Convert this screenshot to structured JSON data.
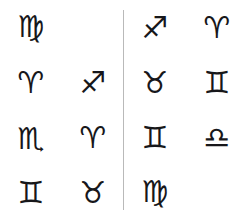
{
  "canvas": {
    "width": 248,
    "height": 220,
    "background": "#ffffff",
    "glyph_color": "#17171a",
    "divider_color": "#b9b9b9"
  },
  "symbols": {
    "virgo": {
      "name": "virgo-symbol",
      "char": "♍",
      "label": "Virgo",
      "size": 30
    },
    "aries": {
      "name": "aries-symbol",
      "char": "♈",
      "label": "Aries",
      "size": 30
    },
    "sagittarius": {
      "name": "sagittarius-symbol",
      "char": "♐",
      "label": "Sagittarius",
      "size": 30
    },
    "scorpio": {
      "name": "scorpio-symbol",
      "char": "♏",
      "label": "Scorpio",
      "size": 30
    },
    "gemini": {
      "name": "gemini-symbol",
      "char": "♊",
      "label": "Gemini",
      "size": 30
    },
    "taurus": {
      "name": "taurus-symbol",
      "char": "♉",
      "label": "Taurus",
      "size": 30
    },
    "libra": {
      "name": "libra-symbol",
      "char": "♎",
      "label": "Libra",
      "size": 30
    }
  },
  "panels": [
    {
      "id": "left-panel",
      "cells": [
        {
          "symbol": "virgo",
          "char": "♍",
          "label": "Virgo"
        },
        {
          "symbol": null,
          "char": "",
          "label": ""
        },
        {
          "symbol": "aries",
          "char": "♈",
          "label": "Aries"
        },
        {
          "symbol": "sagittarius",
          "char": "♐",
          "label": "Sagittarius"
        },
        {
          "symbol": "scorpio",
          "char": "♏",
          "label": "Scorpio"
        },
        {
          "symbol": "aries",
          "char": "♈",
          "label": "Aries"
        },
        {
          "symbol": "gemini",
          "char": "♊",
          "label": "Gemini"
        },
        {
          "symbol": "taurus",
          "char": "♉",
          "label": "Taurus"
        }
      ]
    },
    {
      "id": "right-panel",
      "cells": [
        {
          "symbol": "sagittarius",
          "char": "♐",
          "label": "Sagittarius"
        },
        {
          "symbol": "aries",
          "char": "♈",
          "label": "Aries"
        },
        {
          "symbol": "taurus",
          "char": "♉",
          "label": "Taurus"
        },
        {
          "symbol": "gemini",
          "char": "♊",
          "label": "Gemini"
        },
        {
          "symbol": "gemini",
          "char": "♊",
          "label": "Gemini"
        },
        {
          "symbol": "libra",
          "char": "♎",
          "label": "Libra"
        },
        {
          "symbol": "virgo",
          "char": "♍",
          "label": "Virgo"
        },
        {
          "symbol": null,
          "char": "",
          "label": ""
        }
      ]
    }
  ]
}
